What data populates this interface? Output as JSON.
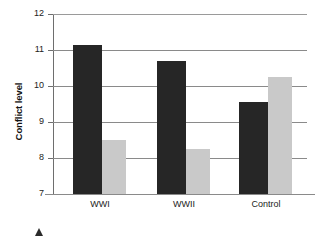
{
  "chart_data": {
    "type": "bar",
    "title": "",
    "subtitle": "",
    "xlabel": "",
    "ylabel": "Conflict level",
    "ylim": [
      7,
      12
    ],
    "yticks": [
      7,
      8,
      9,
      10,
      11,
      12
    ],
    "ytick_labels": [
      "7",
      "8",
      "9",
      "10",
      "11",
      "12"
    ],
    "grid": true,
    "grid_axis": "y",
    "legend": false,
    "legend_position": "none",
    "categories": [
      "WWI",
      "WWII",
      "Control"
    ],
    "series": [
      {
        "name": "dark-series",
        "color": "#262626",
        "values": [
          11.15,
          10.7,
          9.55
        ]
      },
      {
        "name": "light-series",
        "color": "#c9c9c9",
        "values": [
          8.5,
          8.25,
          10.25
        ]
      }
    ],
    "annotations": []
  },
  "axes": {
    "y_title": "Conflict level",
    "y_tick_7": "7",
    "y_tick_8": "8",
    "y_tick_9": "9",
    "y_tick_10": "10",
    "y_tick_11": "11",
    "y_tick_12": "12",
    "x_tick_0": "WWI",
    "x_tick_1": "WWII",
    "x_tick_2": "Control"
  },
  "colors": {
    "bar_dark": "#262626",
    "bar_light": "#c9c9c9",
    "gridline": "#8a8a8a",
    "axis": "#6e6e6e",
    "text": "#222222",
    "background": "#ffffff"
  }
}
